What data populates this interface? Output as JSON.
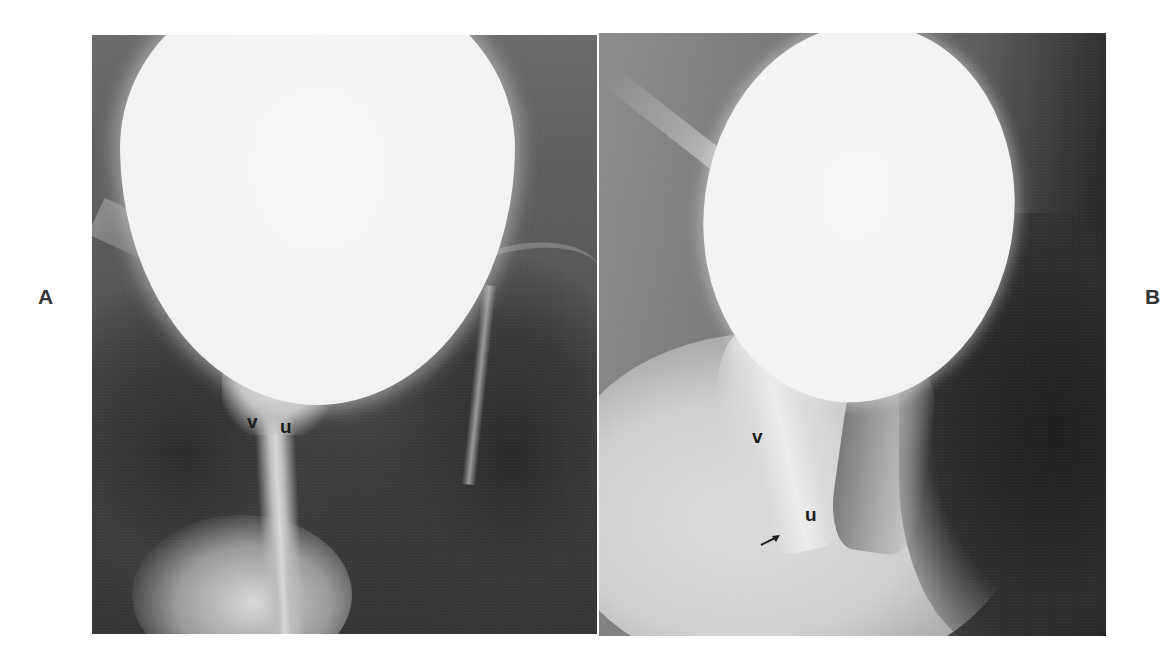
{
  "figure": {
    "panel_labels": {
      "a": "A",
      "b": "B"
    },
    "panels": [
      {
        "id": "A",
        "description": "Radiograph: contrast-filled bladder, frontal view",
        "annotations": [
          {
            "text": "v",
            "x": 255,
            "y": 423
          },
          {
            "text": "u",
            "x": 288,
            "y": 428
          }
        ]
      },
      {
        "id": "B",
        "description": "Radiograph: contrast-filled bladder, oblique view",
        "annotations": [
          {
            "text": "v",
            "x": 760,
            "y": 437
          },
          {
            "text": "u",
            "x": 813,
            "y": 515
          }
        ],
        "arrow": {
          "x": 770,
          "y": 540,
          "direction": "up-right"
        }
      }
    ]
  },
  "colors": {
    "background": "#ffffff",
    "contrast_fill": "#f4f4f4",
    "soft_tissue_dark": "#2e2e2e",
    "soft_tissue_mid": "#6a6a6a",
    "label": "#1c1c1c"
  }
}
